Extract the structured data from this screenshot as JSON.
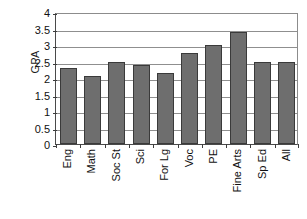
{
  "chart_data": {
    "type": "bar",
    "title": "",
    "xlabel": "",
    "ylabel": "GPA",
    "ylim": [
      0,
      4
    ],
    "ytick_step": 0.5,
    "grid": true,
    "legend": false,
    "bar_color": "#6e6e6e",
    "bar_border_color": "#3a3a3a",
    "gridline_color": "#8f8f8f",
    "axis_color": "#3d3d3d",
    "categories": [
      "Eng",
      "Math",
      "Soc St",
      "Sci",
      "For Lg",
      "Voc",
      "PE",
      "Fine Arts",
      "Sp Ed",
      "All"
    ],
    "values": [
      2.3,
      2.05,
      2.48,
      2.38,
      2.15,
      2.77,
      3.0,
      3.4,
      2.5,
      2.5
    ],
    "ytick_labels": [
      "4",
      "3.5",
      "3",
      "2.5",
      "2",
      "1.5",
      "1",
      "0.5",
      "0"
    ],
    "ytick_values": [
      4,
      3.5,
      3,
      2.5,
      2,
      1.5,
      1,
      0.5,
      0
    ]
  }
}
